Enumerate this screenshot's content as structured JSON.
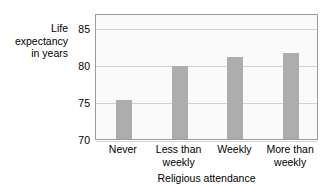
{
  "chart_data": {
    "type": "bar",
    "title": "",
    "categories": [
      "Never",
      "Less than weekly",
      "Weekly",
      "More than weekly"
    ],
    "category_lines": [
      [
        "Never"
      ],
      [
        "Less than",
        "weekly"
      ],
      [
        "Weekly"
      ],
      [
        "More than",
        "weekly"
      ]
    ],
    "values": [
      75.3,
      79.8,
      81.0,
      81.6
    ],
    "xlabel": "Religious attendance",
    "ylabel": "Life expectancy in years",
    "ylabel_lines": [
      "Life",
      "expectancy",
      "in years"
    ],
    "yticks": [
      70,
      75,
      80,
      85
    ],
    "ytick_labels": [
      "70",
      "75",
      "80",
      "85"
    ],
    "ylim": [
      70,
      87
    ],
    "grid": true,
    "legend": false,
    "bar_color": "#adadad",
    "plot_background": "#fafafa",
    "gridline_color": "#d2d2d2",
    "border_color": "#9a9a9a"
  }
}
